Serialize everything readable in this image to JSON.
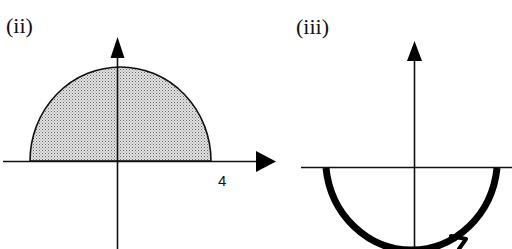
{
  "panels": [
    {
      "id": "ii",
      "label": "(ii)",
      "description": "Shaded upper semicircular region of radius 4 centered at origin",
      "x_axis_tick_label": "4",
      "fill_pattern": "stippled-gray",
      "colors": {
        "stroke": "#111111",
        "fill": "#c8c8c8",
        "dot": "#6a6a6a"
      }
    },
    {
      "id": "iii",
      "label": "(iii)",
      "description": "Thick lower semicircular curve with direction arrow (counterclockwise)",
      "curve_direction": "counterclockwise",
      "colors": {
        "stroke": "#000000"
      }
    }
  ]
}
